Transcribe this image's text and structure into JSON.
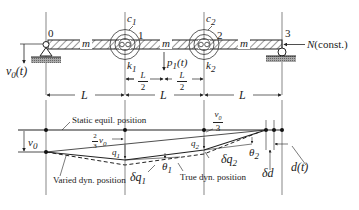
{
  "diagram": {
    "type": "beam-dynamics",
    "top": {
      "nodes": [
        "0",
        "1",
        "2",
        "3"
      ],
      "mass_labels": [
        "m",
        "m",
        "m"
      ],
      "dampers": [
        "c1",
        "c2"
      ],
      "springs": [
        "k1",
        "k2"
      ],
      "load": "p1(t)",
      "axial_force": "N (const.)",
      "support_motion": "v0(t)",
      "spans": [
        "L",
        "L",
        "L"
      ],
      "half_spans": [
        "L/2",
        "L/2"
      ]
    },
    "bottom": {
      "static_label": "Static equil. position",
      "varied_label": "Varied dyn. position",
      "true_label": "True dyn. position",
      "v0": "v0",
      "two_thirds": "2/3 v0",
      "one_third": "v0/3",
      "q1": "q1",
      "q2": "q2",
      "dq1": "δq1",
      "dq2": "δq2",
      "theta1": "θ1",
      "theta2": "θ2",
      "dd": "δd",
      "dt": "d(t)"
    }
  },
  "labels": {
    "n0": "0",
    "n1": "1",
    "n2": "2",
    "n3": "3",
    "m": "m",
    "c": "c",
    "k": "k",
    "s1": "1",
    "s2": "2",
    "p1": "p",
    "p1t": "(t)",
    "N": "N",
    "Nconst": "(const.)",
    "v": "v",
    "v0sub": "0",
    "v0t": "(t)",
    "L": "L",
    "Lh": "L",
    "two": "2",
    "three": "3",
    "static": "Static equil. position",
    "varied": "Varied dyn. position",
    "true": "True dyn. position",
    "q": "q",
    "dq": "δq",
    "theta": "θ",
    "dd": "δd",
    "dt": "d(t)"
  }
}
